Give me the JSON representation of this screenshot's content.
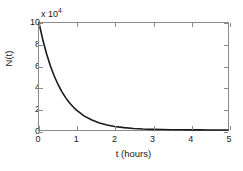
{
  "chart_data": {
    "type": "line",
    "title": "",
    "xlabel": "t (hours)",
    "ylabel": "N(t)",
    "y_multiplier_label": "x 10",
    "y_multiplier_exponent": "4",
    "y_scale_factor": 10000,
    "xlim": [
      0,
      5
    ],
    "ylim": [
      0,
      10
    ],
    "xticks": [
      "0",
      "1",
      "2",
      "3",
      "4",
      "5"
    ],
    "yticks": [
      "0",
      "2",
      "4",
      "6",
      "8",
      "10"
    ],
    "grid": false,
    "legend": null,
    "line_color": "#1a1a1a",
    "axis_color": "#8a8a8a",
    "background_color": "#ffffff",
    "model": "N(t) = 100000 * exp(-1.7 * t)",
    "initial_value": 100000,
    "decay_constant": 1.7,
    "series": [
      {
        "name": "N(t)",
        "x": [
          0,
          0.1,
          0.2,
          0.3,
          0.4,
          0.5,
          0.6,
          0.7,
          0.8,
          0.9,
          1.0,
          1.2,
          1.4,
          1.6,
          1.8,
          2.0,
          2.25,
          2.5,
          2.75,
          3.0,
          3.25,
          3.5,
          3.75,
          4.0,
          4.25,
          4.5,
          4.75,
          5.0
        ],
        "y": [
          10.0,
          8.44,
          7.12,
          6.01,
          5.07,
          4.28,
          3.61,
          3.05,
          2.57,
          2.17,
          1.83,
          1.3,
          0.93,
          0.66,
          0.47,
          0.33,
          0.22,
          0.14,
          0.09,
          0.06,
          0.04,
          0.026,
          0.017,
          0.011,
          0.007,
          0.005,
          0.003,
          0.002
        ]
      }
    ]
  }
}
